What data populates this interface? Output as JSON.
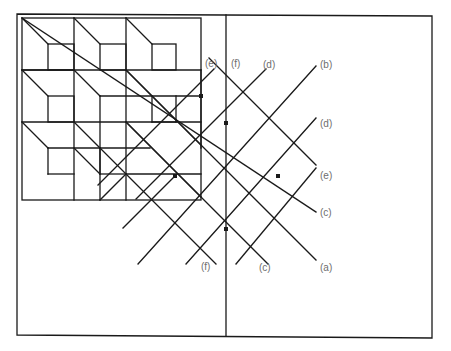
{
  "figure": {
    "stroke_color": "#1a1a1a",
    "label_color": "#6e6e6e"
  },
  "labels": {
    "top": [
      {
        "text": "(e)",
        "x": 205,
        "y": 64
      },
      {
        "text": "(f)",
        "x": 231,
        "y": 64
      },
      {
        "text": "(d)",
        "x": 263,
        "y": 65
      },
      {
        "text": "(b)",
        "x": 320,
        "y": 65
      }
    ],
    "right": [
      {
        "text": "(d)",
        "x": 320,
        "y": 124
      },
      {
        "text": "(e)",
        "x": 320,
        "y": 176
      },
      {
        "text": "(c)",
        "x": 320,
        "y": 213
      },
      {
        "text": "(a)",
        "x": 320,
        "y": 268
      }
    ],
    "bottom": [
      {
        "text": "(f)",
        "x": 201,
        "y": 267
      },
      {
        "text": "(c)",
        "x": 259,
        "y": 268
      }
    ]
  }
}
